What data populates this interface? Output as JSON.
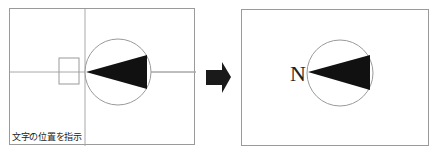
{
  "left_panel": {
    "caption": "文字の位置を指示",
    "crosshair": {
      "x": 75,
      "y": 63
    },
    "text_box": {
      "x": 49,
      "y": 49,
      "w": 20,
      "h": 26
    },
    "circle": {
      "cx": 108,
      "cy": 63,
      "r": 33
    },
    "needle": {
      "tip": [
        76,
        63
      ],
      "base_top": [
        137,
        46
      ],
      "base_bottom": [
        137,
        80
      ]
    }
  },
  "arrow": {
    "direction": "right",
    "color": "#1a1a1a"
  },
  "right_panel": {
    "label": "N",
    "circle": {
      "cx": 98,
      "cy": 63,
      "r": 33
    },
    "needle": {
      "tip": [
        66,
        62
      ],
      "base_top": [
        128,
        45
      ],
      "base_bottom": [
        128,
        80
      ]
    }
  },
  "colors": {
    "stroke": "#9a9a9a",
    "fill": "#111111"
  }
}
